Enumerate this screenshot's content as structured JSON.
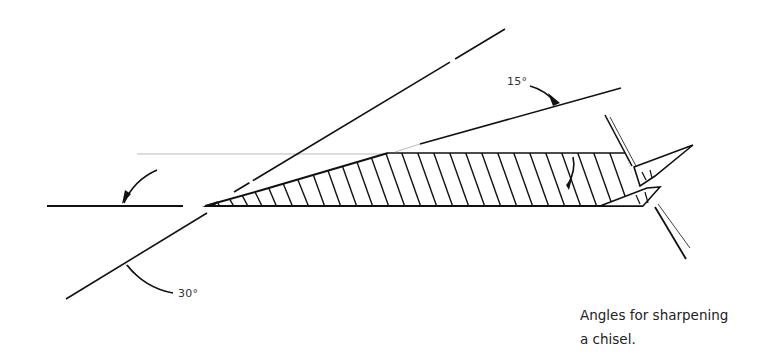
{
  "figure": {
    "caption_line1": "Angles for sharpening",
    "caption_line2": "a chisel.",
    "labels": {
      "angle_15": "15°",
      "angle_30": "30°"
    },
    "colors": {
      "ink": "#111111",
      "faint": "#bbbbbb",
      "background": "#ffffff"
    }
  }
}
